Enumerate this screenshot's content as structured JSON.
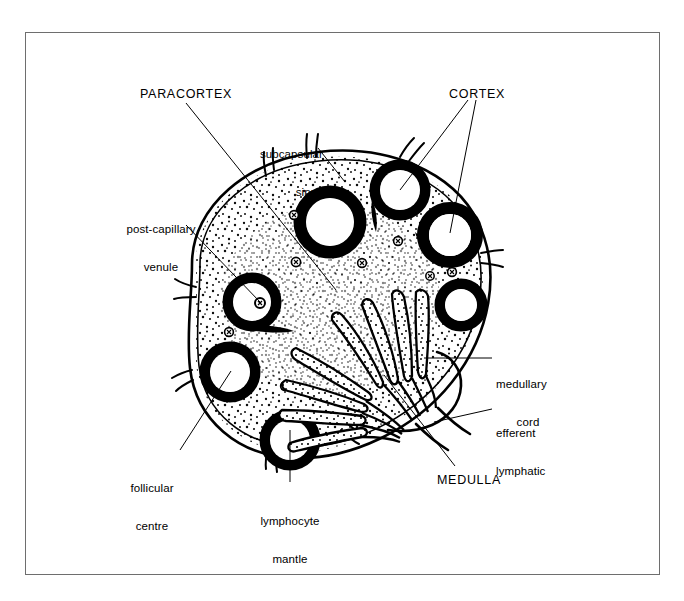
{
  "figure": {
    "type": "anatomical-line-diagram",
    "background_color": "#ffffff",
    "ink_color": "#000000",
    "frame_color": "#6e6e6e",
    "frame": {
      "x": 25,
      "y": 32,
      "width": 635,
      "height": 543
    }
  },
  "labels": {
    "paracortex": {
      "text": "PARACORTEX",
      "style": "uppercase",
      "align": "left",
      "x": 140,
      "y": 87,
      "leader": "line from label down-right into the paracortex stippled zone"
    },
    "cortex": {
      "text": "CORTEX",
      "style": "uppercase",
      "align": "left",
      "x": 449,
      "y": 87,
      "leader": "two lines branching to two cortical follicles"
    },
    "subcapsular_sinus": {
      "line1": "subcapsular",
      "line2": "sinus",
      "style": "lowercase",
      "align": "right",
      "x": 253,
      "y": 122,
      "leader": "line down-right to the capsule double-line"
    },
    "post_capillary_venule": {
      "line1": "post-capillary",
      "line2": "venule",
      "style": "lowercase",
      "align": "center",
      "x": 131,
      "y": 197,
      "leader": "line down-right to a small venule profile"
    },
    "follicular_centre": {
      "line1": "follicular",
      "line2": "centre",
      "style": "lowercase",
      "align": "center",
      "x": 139,
      "y": 456,
      "leader": "line up-right to pale centre of a follicle"
    },
    "lymphocyte_mantle": {
      "line1": "lymphocyte",
      "line2": "mantle",
      "style": "lowercase",
      "align": "center",
      "x": 251,
      "y": 489,
      "leader": "vertical line up to the thick dark ring of a follicle"
    },
    "medulla": {
      "text": "MEDULLA",
      "style": "uppercase",
      "align": "left",
      "x": 437,
      "y": 473,
      "leader": "line up-left into the medullary region"
    },
    "medullary_cord": {
      "line1": "medullary",
      "line2": "cord",
      "style": "lowercase",
      "align": "left",
      "x": 496,
      "y": 352,
      "leader": "horizontal line left to a medullary cord"
    },
    "efferent_lymphatic": {
      "line1": "efferent",
      "line2": "lymphatic",
      "style": "lowercase",
      "align": "left",
      "x": 496,
      "y": 401,
      "leader": "line down-left to the efferent vessel at the hilum"
    }
  },
  "structures": {
    "capsule": "double outline enclosing an ovoid lymph node with short afferent lymphatic stubs projecting outward",
    "subcapsular_sinus": "narrow channel between the outer capsule line and inner cortical boundary",
    "cortical_follicles": 7,
    "follicle_description": "thick black ring (lymphocyte mantle) with pale interior (follicular centre)",
    "paracortex": "finely stippled interfollicular zone filling the node interior",
    "post_capillary_venules": "small circular profiles with internal dot scattered in the paracortex",
    "medullary_cords": "branching finger-like stippled cords radiating from the hilum toward the cortex",
    "efferent_lymphatic": "single vessel leaving the node at the hilum on the right",
    "hilum_position": "right-lower aspect of the node"
  }
}
